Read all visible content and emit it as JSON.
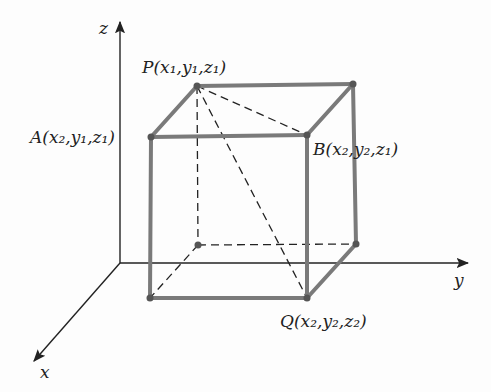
{
  "diagram": {
    "type": "3d-rectangular-box",
    "colors": {
      "edge": "#7a7a7a",
      "axis": "#222222",
      "dashed": "#222222",
      "text": "#222222"
    },
    "axes": {
      "x": {
        "label": "x"
      },
      "y": {
        "label": "y"
      },
      "z": {
        "label": "z"
      }
    },
    "points": {
      "P": {
        "name": "P",
        "label": "P(x₁,y₁,z₁)",
        "coords": [
          "x₁",
          "y₁",
          "z₁"
        ]
      },
      "A": {
        "name": "A",
        "label": "A(x₂,y₁,z₁)",
        "coords": [
          "x₂",
          "y₁",
          "z₁"
        ]
      },
      "B": {
        "name": "B",
        "label": "B(x₂,y₂,z₁)",
        "coords": [
          "x₂",
          "y₂",
          "z₁"
        ]
      },
      "Q": {
        "name": "Q",
        "label": "Q(x₂,y₂,z₂)",
        "coords": [
          "x₂",
          "y₂",
          "z₂"
        ]
      }
    },
    "segments": {
      "dashed": [
        "P–B",
        "P–Q",
        "P–back-bottom-left",
        "back-bottom-left–front-bottom-left",
        "back-bottom-left–back-bottom-right"
      ]
    }
  }
}
